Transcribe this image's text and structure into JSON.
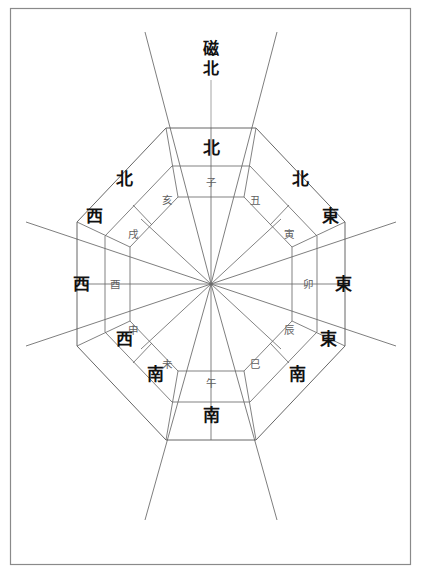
{
  "figure": {
    "kind": "compass-rose-diagram",
    "title_label": "磁北",
    "title_lines": [
      "磁",
      "北"
    ],
    "background_color": "#ffffff",
    "frame_color": "#8a8a8a",
    "line_color": "#4a4a4a",
    "major_text_color": "#111111",
    "minor_text_color": "#5e5e5e"
  },
  "outer_ring": {
    "name": "八方位-outer",
    "sectors": [
      {
        "id": "n",
        "label": "北",
        "bearing_deg": 0,
        "position": "top"
      },
      {
        "id": "ne",
        "label": "北東",
        "label_lines": [
          "北",
          "東"
        ],
        "bearing_deg": 45,
        "position": "top-right"
      },
      {
        "id": "e",
        "label": "東",
        "bearing_deg": 90,
        "position": "right"
      },
      {
        "id": "se",
        "label": "東南",
        "label_lines": [
          "東",
          "南"
        ],
        "bearing_deg": 135,
        "position": "bottom-right"
      },
      {
        "id": "s",
        "label": "南",
        "bearing_deg": 180,
        "position": "bottom"
      },
      {
        "id": "sw",
        "label": "西南",
        "label_lines": [
          "西",
          "南"
        ],
        "bearing_deg": 225,
        "position": "bottom-left"
      },
      {
        "id": "w",
        "label": "西",
        "bearing_deg": 270,
        "position": "left"
      },
      {
        "id": "nw",
        "label": "西北",
        "label_lines": [
          "西",
          "北"
        ],
        "bearing_deg": 315,
        "position": "top-left"
      }
    ]
  },
  "inner_ring": {
    "name": "十二支-inner",
    "sectors": [
      {
        "id": "zi",
        "label": "子",
        "bearing_deg": 0,
        "position": "top"
      },
      {
        "id": "chou",
        "label": "丑",
        "bearing_deg": 30,
        "position": "north-northeast"
      },
      {
        "id": "yin",
        "label": "寅",
        "bearing_deg": 60,
        "position": "east-northeast"
      },
      {
        "id": "mao",
        "label": "卯",
        "bearing_deg": 90,
        "position": "right"
      },
      {
        "id": "chen",
        "label": "辰",
        "bearing_deg": 120,
        "position": "east-southeast"
      },
      {
        "id": "si",
        "label": "巳",
        "bearing_deg": 150,
        "position": "south-southeast"
      },
      {
        "id": "wu",
        "label": "午",
        "bearing_deg": 180,
        "position": "bottom"
      },
      {
        "id": "wei",
        "label": "未",
        "bearing_deg": 210,
        "position": "south-southwest"
      },
      {
        "id": "shen",
        "label": "申",
        "bearing_deg": 240,
        "position": "west-southwest"
      },
      {
        "id": "you",
        "label": "酉",
        "bearing_deg": 270,
        "position": "left"
      },
      {
        "id": "xu",
        "label": "戌",
        "bearing_deg": 300,
        "position": "west-northwest"
      },
      {
        "id": "hai",
        "label": "亥",
        "bearing_deg": 330,
        "position": "north-northwest"
      }
    ]
  }
}
